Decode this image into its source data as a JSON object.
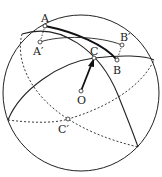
{
  "diagram": {
    "labels": {
      "A": "A",
      "A_prime": "A′",
      "B": "B",
      "B_prime": "B′",
      "C": "C",
      "C_prime": "C′",
      "O": "O"
    },
    "colors": {
      "stroke": "#222222",
      "background": "#ffffff"
    }
  }
}
